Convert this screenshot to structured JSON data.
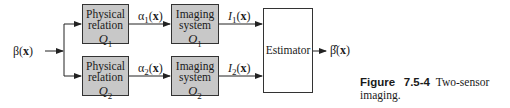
{
  "diagram": {
    "input": {
      "symbol": "β",
      "arg": "x"
    },
    "output": {
      "symbol": "β̂",
      "arg": "x"
    },
    "branches": [
      {
        "physical": {
          "line1": "Physical",
          "line2": "relation",
          "symbol": "Q",
          "sub": "1"
        },
        "intermediate": {
          "symbol": "α",
          "sub": "1",
          "arg": "x"
        },
        "imaging": {
          "line1": "Imaging",
          "line2": "system",
          "symbol": "O",
          "sub": "1"
        },
        "measurement": {
          "symbol": "I",
          "sub": "1",
          "arg": "x"
        }
      },
      {
        "physical": {
          "line1": "Physical",
          "line2": "relation",
          "symbol": "Q",
          "sub": "2"
        },
        "intermediate": {
          "symbol": "α",
          "sub": "2",
          "arg": "x"
        },
        "imaging": {
          "line1": "Imaging",
          "line2": "system",
          "symbol": "O",
          "sub": "2"
        },
        "measurement": {
          "symbol": "I",
          "sub": "2",
          "arg": "x"
        }
      }
    ],
    "estimator": {
      "label": "Estimator"
    }
  },
  "caption": {
    "figure_label": "Figure",
    "number": "7.5-4",
    "text": "Two-sensor imaging."
  }
}
